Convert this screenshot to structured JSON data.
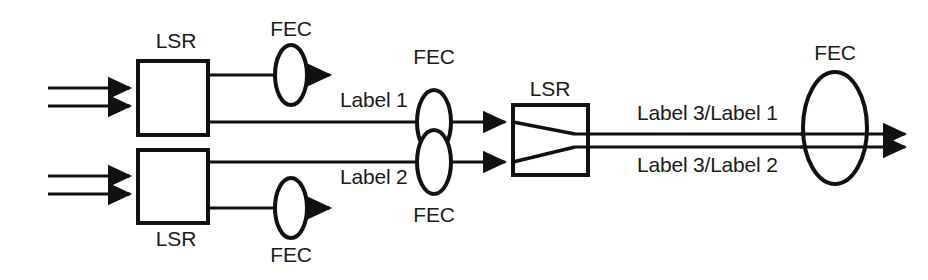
{
  "diagram": {
    "background_color": "#ffffff",
    "line_color": "#111111",
    "nodes": {
      "lsr_top_left": {
        "label": "LSR",
        "label_position": "above"
      },
      "lsr_bottom_left": {
        "label": "LSR",
        "label_position": "below"
      },
      "lsr_middle": {
        "label": "LSR",
        "label_position": "above"
      },
      "fec_top_left": {
        "label": "FEC",
        "label_position": "above"
      },
      "fec_bottom_left": {
        "label": "FEC",
        "label_position": "below"
      },
      "fec_label1": {
        "label": "FEC",
        "label_position": "above"
      },
      "fec_label2": {
        "label": "FEC",
        "label_position": "below"
      },
      "fec_output": {
        "label": "FEC",
        "label_position": "above"
      }
    },
    "link_labels": {
      "label_1": "Label 1",
      "label_2": "Label 2",
      "label_3_label_1": "Label 3/Label 1",
      "label_3_label_2": "Label 3/Label 2"
    },
    "ingress_arrows": {
      "top_count": 2,
      "bottom_count": 2
    },
    "egress_arrows": {
      "count": 2
    }
  }
}
